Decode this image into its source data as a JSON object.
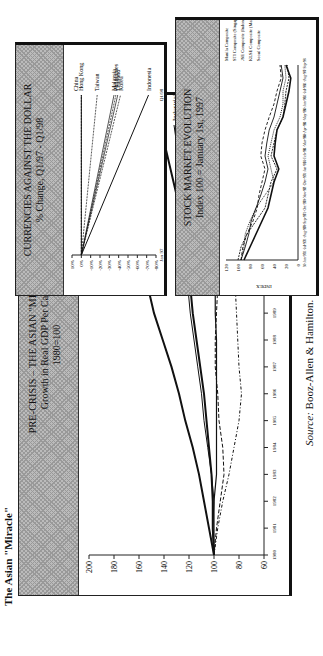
{
  "page": {
    "heading": "The Asian \"Miracle\"",
    "source_label": "Source:",
    "source_text": "Booz-Allen & Hamilton."
  },
  "panels": {
    "gdp": {
      "title": "PRE-CRISIS – THE ASIAN \"MIRACLE\"",
      "subtitle": "Growth in Real GDP Per Capita",
      "note": "1980=100"
    },
    "currencies": {
      "title": "CURRENCIES AGAINST THE DOLLAR",
      "subtitle": "% Change, Q1/97 - Q1/98"
    },
    "stocks": {
      "title": "STOCK MARKET EVOLUTION",
      "subtitle": "Index 100 = January 1st, 1997"
    }
  },
  "chart_data": [
    {
      "type": "line",
      "title": "PRE-CRISIS – THE ASIAN \"MIRACLE\" Growth in Real GDP Per Capita 1980=100",
      "xlabel": "",
      "ylabel": "",
      "ylim": [
        60,
        200
      ],
      "yticks": [
        60,
        80,
        100,
        120,
        140,
        160,
        180,
        200
      ],
      "x": [
        1980,
        1981,
        1982,
        1983,
        1984,
        1985,
        1986,
        1987,
        1988,
        1989,
        1990,
        1991,
        1992,
        1993,
        1994,
        1995,
        1996
      ],
      "series": [
        {
          "name": "Asia",
          "values": [
            100,
            104,
            108,
            112,
            117,
            123,
            128,
            134,
            141,
            148,
            153,
            160,
            166,
            172,
            180,
            187,
            194
          ]
        },
        {
          "name": "Europe",
          "values": [
            100,
            101,
            101,
            102,
            104,
            106,
            108,
            111,
            114,
            117,
            119,
            121,
            124,
            128,
            133,
            138,
            143
          ]
        },
        {
          "name": "Industrialized countries",
          "values": [
            100,
            101,
            100,
            102,
            105,
            108,
            110,
            113,
            116,
            119,
            121,
            121,
            122,
            124,
            127,
            129,
            132
          ]
        },
        {
          "name": "Latin America",
          "values": [
            100,
            98,
            95,
            92,
            93,
            96,
            97,
            99,
            99,
            98,
            97,
            100,
            102,
            104,
            107,
            110,
            113
          ]
        },
        {
          "name": "Africa",
          "values": [
            100,
            100,
            100,
            98,
            98,
            98,
            98,
            98,
            98,
            99,
            99,
            100,
            100,
            101,
            102,
            103,
            104
          ]
        },
        {
          "name": "Middle East",
          "values": [
            100,
            97,
            93,
            88,
            84,
            80,
            78,
            80,
            81,
            82,
            83,
            85,
            85,
            84,
            84,
            85,
            85
          ]
        }
      ],
      "grid": false,
      "legend_position": "inline labels at line ends"
    },
    {
      "type": "line",
      "title": "CURRENCIES AGAINST THE DOLLAR % Change, Q1/97 - Q1/98",
      "x": [
        "Jan 97",
        "Q1/98"
      ],
      "ylim": [
        -80,
        10
      ],
      "yticks": [
        "10%",
        "0%",
        "-10%",
        "-20%",
        "-30%",
        "-40%",
        "-50%",
        "-60%",
        "-70%",
        "-80%"
      ],
      "series": [
        {
          "name": "China",
          "values": [
            0,
            0
          ]
        },
        {
          "name": "Hong Kong",
          "values": [
            0,
            0
          ]
        },
        {
          "name": "Taiwan",
          "values": [
            0,
            -17
          ]
        },
        {
          "name": "Malaysia",
          "values": [
            0,
            -35
          ]
        },
        {
          "name": "Philippines",
          "values": [
            0,
            -37
          ]
        },
        {
          "name": "Thailand",
          "values": [
            0,
            -39
          ]
        },
        {
          "name": "Korea",
          "values": [
            0,
            -42
          ]
        },
        {
          "name": "Indonesia",
          "values": [
            0,
            -72
          ]
        }
      ]
    },
    {
      "type": "line",
      "title": "STOCK MARKET EVOLUTION Index 100 = January 1st, 1997",
      "ylabel": "INDEX",
      "ylim": [
        0,
        120
      ],
      "yticks": [
        0,
        20,
        40,
        60,
        80,
        100,
        120
      ],
      "x": [
        "30-Jun-97",
        "31-Jul-97",
        "31-Aug-97",
        "30-Sep-97",
        "31-Oct-97",
        "30-Nov-97",
        "31-Dec-97",
        "31-Jan-98",
        "28-Feb-98",
        "31-Mar-98",
        "30-Apr-98",
        "31-May-98",
        "30-Jun-98",
        "31-Jul-98",
        "31-Aug-98",
        "7-Sep-98"
      ],
      "series": [
        {
          "name": "Manila Composite",
          "values": [
            95,
            92,
            85,
            75,
            68,
            65,
            60,
            55,
            62,
            60,
            55,
            48,
            40,
            35,
            28,
            30
          ]
        },
        {
          "name": "STI Composite (Singapore)",
          "values": [
            95,
            88,
            82,
            78,
            70,
            62,
            55,
            50,
            55,
            52,
            48,
            40,
            35,
            30,
            25,
            28
          ]
        },
        {
          "name": "JSE Composite (Indonesia)",
          "values": [
            100,
            95,
            85,
            70,
            55,
            50,
            45,
            35,
            45,
            40,
            35,
            25,
            22,
            20,
            15,
            18
          ]
        },
        {
          "name": "KLSE Composite (Malaysia)",
          "values": [
            90,
            80,
            70,
            60,
            50,
            45,
            40,
            32,
            40,
            38,
            35,
            25,
            20,
            15,
            12,
            20
          ]
        },
        {
          "name": "Seoul Composite",
          "values": [
            95,
            90,
            88,
            80,
            70,
            55,
            40,
            45,
            50,
            45,
            40,
            30,
            25,
            25,
            20,
            22
          ]
        }
      ]
    }
  ]
}
